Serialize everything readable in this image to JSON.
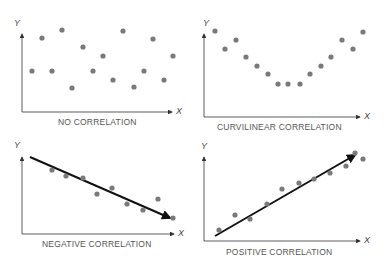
{
  "panels": [
    {
      "id": "no",
      "label": "NO CORRELATION",
      "x_axis": "X",
      "y_axis": "Y"
    },
    {
      "id": "curv",
      "label": "CURVILINEAR CORRELATION",
      "x_axis": "X",
      "y_axis": "Y"
    },
    {
      "id": "neg",
      "label": "NEGATIVE CORRELATION",
      "x_axis": "X",
      "y_axis": "Y"
    },
    {
      "id": "pos",
      "label": "POSITIVE CORRELATION",
      "x_axis": "X",
      "y_axis": "Y"
    }
  ],
  "colors": {
    "dot": "#7a7a7a",
    "axis": "#333333",
    "line": "#111111",
    "text": "#555555"
  },
  "chart_data": [
    {
      "type": "scatter",
      "title": "NO CORRELATION",
      "points": [
        [
          32,
          71
        ],
        [
          42,
          38
        ],
        [
          52,
          71
        ],
        [
          62,
          30
        ],
        [
          72,
          88
        ],
        [
          83,
          47
        ],
        [
          93,
          71
        ],
        [
          103,
          56
        ],
        [
          113,
          80
        ],
        [
          123,
          31
        ],
        [
          134,
          87
        ],
        [
          144,
          71
        ],
        [
          153,
          39
        ],
        [
          164,
          80
        ],
        [
          173,
          56
        ]
      ],
      "trend": null
    },
    {
      "type": "scatter",
      "title": "CURVILINEAR CORRELATION",
      "points": [
        [
          215,
          31
        ],
        [
          225,
          49
        ],
        [
          236,
          40
        ],
        [
          246,
          57
        ],
        [
          257,
          66
        ],
        [
          268,
          74
        ],
        [
          278,
          84
        ],
        [
          288,
          84
        ],
        [
          300,
          84
        ],
        [
          310,
          74
        ],
        [
          321,
          66
        ],
        [
          331,
          57
        ],
        [
          342,
          40
        ],
        [
          353,
          49
        ],
        [
          363,
          32
        ]
      ],
      "trend": "U-shaped"
    },
    {
      "type": "scatter",
      "title": "NEGATIVE CORRELATION",
      "points": [
        [
          52,
          170
        ],
        [
          66,
          176
        ],
        [
          83,
          178
        ],
        [
          97,
          194
        ],
        [
          112,
          188
        ],
        [
          127,
          204
        ],
        [
          143,
          210
        ],
        [
          158,
          199
        ],
        [
          173,
          218
        ]
      ],
      "trend_line": [
        [
          30,
          157
        ],
        [
          170,
          218
        ]
      ]
    },
    {
      "type": "scatter",
      "title": "POSITIVE CORRELATION",
      "points": [
        [
          219,
          230
        ],
        [
          235,
          215
        ],
        [
          250,
          219
        ],
        [
          267,
          204
        ],
        [
          282,
          189
        ],
        [
          299,
          183
        ],
        [
          314,
          179
        ],
        [
          330,
          173
        ],
        [
          346,
          166
        ],
        [
          355,
          153
        ],
        [
          363,
          159
        ]
      ],
      "trend_line": [
        [
          215,
          236
        ],
        [
          355,
          155
        ]
      ]
    }
  ]
}
